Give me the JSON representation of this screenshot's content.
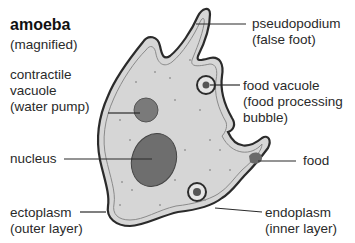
{
  "diagram": {
    "title": "amoeba",
    "subtitle": "(magnified)",
    "labels": {
      "contractile_vacuole": {
        "line1": "contractile",
        "line2": "vacuole",
        "line3": "(water pump)"
      },
      "nucleus": {
        "line1": "nucleus"
      },
      "ectoplasm": {
        "line1": "ectoplasm",
        "line2": "(outer layer)"
      },
      "pseudopodium": {
        "line1": "pseudopodium",
        "line2": "(false foot)"
      },
      "food_vacuole": {
        "line1": "food vacuole",
        "line2": "(food processing",
        "line3": "bubble)"
      },
      "food": {
        "line1": "food"
      },
      "endoplasm": {
        "line1": "endoplasm",
        "line2": "(inner layer)"
      }
    },
    "colors": {
      "cytoplasm": "#d6d6d6",
      "outline": "#2b2b2b",
      "organelle": "#7a7a7a",
      "nucleus": "#6e6e6e"
    }
  }
}
